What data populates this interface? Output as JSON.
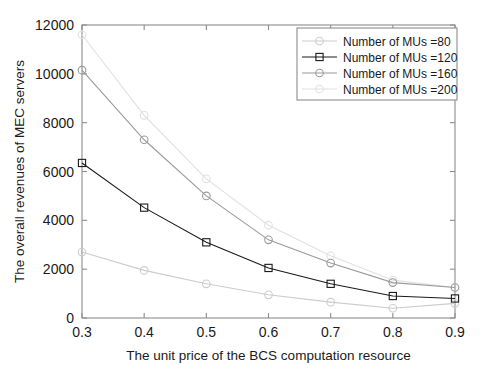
{
  "chart_data": {
    "type": "line",
    "title": "",
    "xlabel": "The unit price of the BCS computation resource",
    "ylabel": "The overall revenues of MEC servers",
    "x": [
      0.3,
      0.4,
      0.5,
      0.6,
      0.7,
      0.8,
      0.9
    ],
    "xlim": [
      0.3,
      0.9
    ],
    "ylim": [
      0,
      12000
    ],
    "xticks": [
      "0.3",
      "0.4",
      "0.5",
      "0.6",
      "0.7",
      "0.8",
      "0.9"
    ],
    "yticks": [
      "0",
      "2000",
      "4000",
      "6000",
      "8000",
      "10000",
      "12000"
    ],
    "grid": false,
    "legend_position": "upper right",
    "series": [
      {
        "name": "Number of MUs =80",
        "values": [
          2700,
          1950,
          1400,
          950,
          650,
          400,
          600
        ],
        "color": "#cccccc",
        "marker": "circle"
      },
      {
        "name": "Number of MUs =120",
        "values": [
          6350,
          4520,
          3100,
          2050,
          1400,
          900,
          800
        ],
        "color": "#1a1a1a",
        "marker": "square"
      },
      {
        "name": "Number of MUs =160",
        "values": [
          10150,
          7300,
          5000,
          3200,
          2250,
          1450,
          1250
        ],
        "color": "#9a9a9a",
        "marker": "circle"
      },
      {
        "name": "Number of MUs =200",
        "values": [
          11600,
          8300,
          5700,
          3800,
          2550,
          1550,
          1250
        ],
        "color": "#e0e0e0",
        "marker": "circle"
      }
    ]
  },
  "legend": {
    "entries": [
      "Number of MUs =80",
      "Number of MUs =120",
      "Number of MUs =160",
      "Number of MUs =200"
    ]
  }
}
